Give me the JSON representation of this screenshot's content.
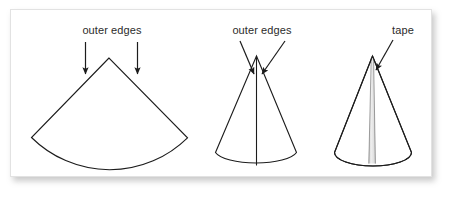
{
  "figure": {
    "title": "",
    "background_color": "#ffffff",
    "panel_border_color": "#e2e2e2",
    "line_color": "#1c1c1c",
    "text_color": "#2b2b2b",
    "tape_color": "#d9d9d9",
    "labels": {
      "sector_outer_edges": "outer edges",
      "cone_outer_edges": "outer edges",
      "tape": "tape"
    },
    "parts": [
      {
        "name": "flat-sector",
        "description": "circular sector cut from paper",
        "callout": "outer edges",
        "arrow_count": 2
      },
      {
        "name": "rolled-cone",
        "description": "sector rolled into a cone with overlapping outer edges",
        "callout": "outer edges",
        "arrow_count": 2
      },
      {
        "name": "taped-cone",
        "description": "cone with a strip of tape along the seam",
        "callout": "tape",
        "arrow_count": 1
      }
    ]
  }
}
